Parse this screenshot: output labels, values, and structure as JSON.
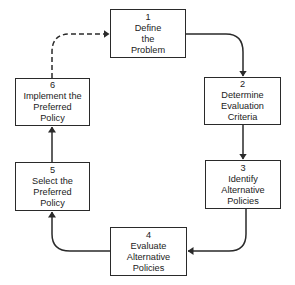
{
  "diagram": {
    "type": "policy-analysis-cycle",
    "line_color": "#2a2a2a",
    "steps": [
      {
        "number": "1",
        "lines": [
          "Define",
          "the",
          "Problem"
        ]
      },
      {
        "number": "2",
        "lines": [
          "Determine",
          "Evaluation",
          "Criteria"
        ]
      },
      {
        "number": "3",
        "lines": [
          "Identify",
          "Alternative",
          "Policies"
        ]
      },
      {
        "number": "4",
        "lines": [
          "Evaluate",
          "Alternative",
          "Policies"
        ]
      },
      {
        "number": "5",
        "lines": [
          "Select the",
          "Preferred",
          "Policy"
        ]
      },
      {
        "number": "6",
        "lines": [
          "Implement the",
          "Preferred",
          "Policy"
        ]
      }
    ],
    "edges": [
      {
        "from": "1",
        "to": "2",
        "style": "solid"
      },
      {
        "from": "2",
        "to": "3",
        "style": "solid"
      },
      {
        "from": "3",
        "to": "4",
        "style": "solid"
      },
      {
        "from": "4",
        "to": "5",
        "style": "solid"
      },
      {
        "from": "5",
        "to": "6",
        "style": "solid"
      },
      {
        "from": "6",
        "to": "1",
        "style": "dashed"
      }
    ]
  }
}
